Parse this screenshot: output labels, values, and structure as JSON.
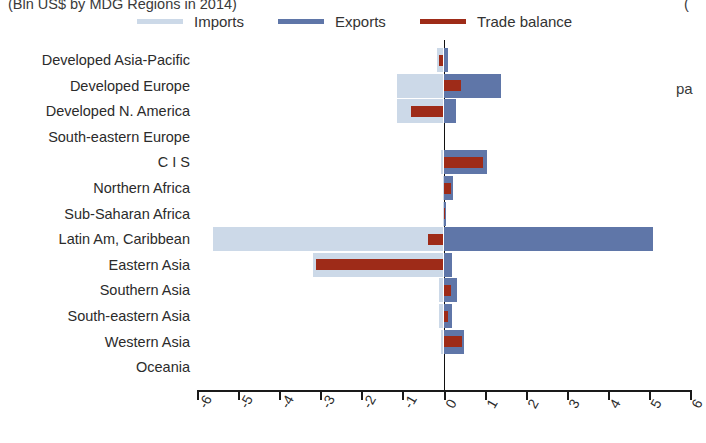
{
  "title": {
    "text": "(Bln US$ by MDG Regions in 2014)",
    "right_fragment": "("
  },
  "legend": {
    "position": "top",
    "items": [
      {
        "label": "Imports",
        "color": "#ccd9e8",
        "icon": "line-swatch-icon"
      },
      {
        "label": "Exports",
        "color": "#5f76a8",
        "icon": "line-swatch-icon"
      },
      {
        "label": "Trade balance",
        "color": "#9e2b18",
        "icon": "line-swatch-icon"
      }
    ]
  },
  "side_note": {
    "line1": "",
    "line2": "pa"
  },
  "chart_data": {
    "type": "bar",
    "orientation": "horizontal",
    "title": "(Bln US$ by MDG Regions in 2014)",
    "xlabel": "",
    "ylabel": "",
    "xlim": [
      -6,
      6
    ],
    "xticks": [
      -6,
      -5,
      -4,
      -3,
      -2,
      -1,
      0,
      1,
      2,
      3,
      4,
      5,
      6
    ],
    "xticklabels": [
      "-6",
      "-5",
      "-4",
      "-3",
      "-2",
      "-1",
      "0",
      "1",
      "2",
      "3",
      "4",
      "5",
      "6"
    ],
    "grid": false,
    "legend_position": "top",
    "categories": [
      "Developed Asia-Pacific",
      "Developed Europe",
      "Developed N. America",
      "South-eastern Europe",
      "C I S",
      "Northern Africa",
      "Sub-Saharan Africa",
      "Latin Am, Caribbean",
      "Eastern Asia",
      "Southern Asia",
      "South-eastern Asia",
      "Western Asia",
      "Oceania"
    ],
    "series": [
      {
        "name": "Imports",
        "color": "#ccd9e8",
        "values": [
          -0.15,
          -1.12,
          -1.12,
          0.0,
          -0.05,
          -0.02,
          -0.02,
          -5.62,
          -3.18,
          -0.1,
          -0.12,
          -0.05,
          0.0
        ]
      },
      {
        "name": "Exports",
        "color": "#5f76a8",
        "values": [
          0.1,
          1.4,
          0.3,
          0.0,
          1.05,
          0.22,
          0.06,
          5.1,
          0.2,
          0.32,
          0.2,
          0.5,
          0.0
        ]
      },
      {
        "name": "Trade balance",
        "color": "#9e2b18",
        "values": [
          -0.1,
          0.42,
          -0.78,
          0.0,
          0.95,
          0.18,
          0.04,
          -0.38,
          -3.1,
          0.18,
          0.1,
          0.45,
          0.0
        ]
      }
    ]
  }
}
